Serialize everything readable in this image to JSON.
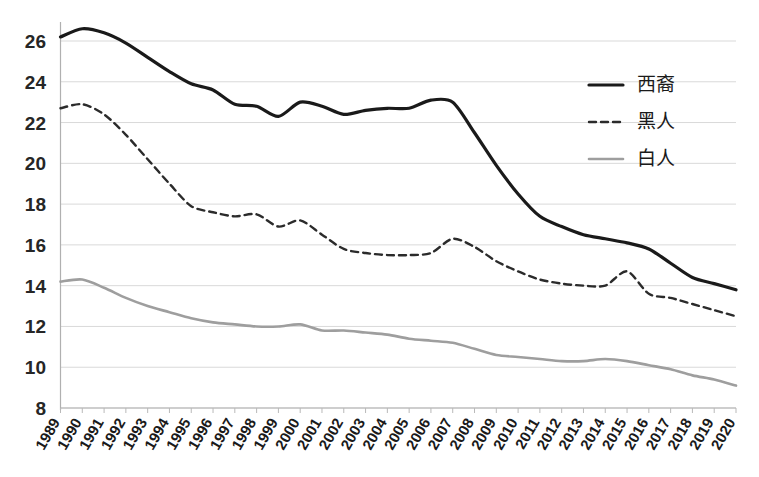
{
  "chart_data": {
    "type": "line",
    "title": "",
    "subtitle": "",
    "xlabel": "",
    "ylabel": "",
    "grid": true,
    "legend_position": "top-right",
    "xlim": [
      1989,
      2020
    ],
    "ylim": [
      8,
      26
    ],
    "ytick_labels": [
      "8",
      "10",
      "12",
      "14",
      "16",
      "18",
      "20",
      "22",
      "24",
      "26"
    ],
    "ytick_values": [
      8,
      10,
      12,
      14,
      16,
      18,
      20,
      22,
      24,
      26
    ],
    "categories": [
      "1989",
      "1990",
      "1991",
      "1992",
      "1993",
      "1994",
      "1995",
      "1996",
      "1997",
      "1998",
      "1999",
      "2000",
      "2001",
      "2002",
      "2003",
      "2004",
      "2005",
      "2006",
      "2007",
      "2008",
      "2009",
      "2010",
      "2011",
      "2012",
      "2013",
      "2014",
      "2015",
      "2016",
      "2017",
      "2018",
      "2019",
      "2020"
    ],
    "series": [
      {
        "name": "西裔",
        "style": "solid",
        "color": "#1a1a1a",
        "width": 3.2,
        "values": [
          26.2,
          26.6,
          26.4,
          25.9,
          25.2,
          24.5,
          23.9,
          23.6,
          22.9,
          22.8,
          22.3,
          23.0,
          22.8,
          22.4,
          22.6,
          22.7,
          22.7,
          23.1,
          23.0,
          21.5,
          19.9,
          18.5,
          17.4,
          16.9,
          16.5,
          16.3,
          16.1,
          15.8,
          15.1,
          14.4,
          14.1,
          13.8
        ]
      },
      {
        "name": "黑人",
        "style": "dashed",
        "color": "#2b2b2b",
        "width": 2.4,
        "values": [
          22.7,
          22.9,
          22.4,
          21.4,
          20.2,
          19.0,
          17.9,
          17.6,
          17.4,
          17.5,
          16.9,
          17.2,
          16.5,
          15.8,
          15.6,
          15.5,
          15.5,
          15.6,
          16.3,
          15.9,
          15.2,
          14.7,
          14.3,
          14.1,
          14.0,
          14.0,
          14.7,
          13.6,
          13.4,
          13.1,
          12.8,
          12.5
        ]
      },
      {
        "name": "白人",
        "style": "solid",
        "color": "#9e9e9e",
        "width": 2.6,
        "values": [
          14.2,
          14.3,
          13.9,
          13.4,
          13.0,
          12.7,
          12.4,
          12.2,
          12.1,
          12.0,
          12.0,
          12.1,
          11.8,
          11.8,
          11.7,
          11.6,
          11.4,
          11.3,
          11.2,
          10.9,
          10.6,
          10.5,
          10.4,
          10.3,
          10.3,
          10.4,
          10.3,
          10.1,
          9.9,
          9.6,
          9.4,
          9.1
        ]
      }
    ],
    "legend": [
      {
        "label": "西裔",
        "style": "solid",
        "color": "#1a1a1a"
      },
      {
        "label": "黑人",
        "style": "dashed",
        "color": "#2b2b2b"
      },
      {
        "label": "白人",
        "style": "solid",
        "color": "#9e9e9e"
      }
    ]
  }
}
